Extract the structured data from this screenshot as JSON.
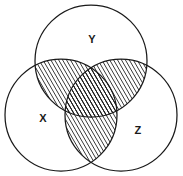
{
  "figure": {
    "background_color": "#ffffff",
    "stroke_color": "#1a1a1a",
    "hatch_color": "#1a1a1a",
    "width": 183,
    "height": 176
  },
  "sets": [
    {
      "id": "X",
      "label": "X",
      "label_x": 43,
      "label_y": 119,
      "cx": 61,
      "cy": 115,
      "r": 56
    },
    {
      "id": "Y",
      "label": "Y",
      "label_x": 92,
      "label_y": 40,
      "cx": 91,
      "cy": 61,
      "r": 56
    },
    {
      "id": "Z",
      "label": "Z",
      "label_x": 138,
      "label_y": 131,
      "cx": 121,
      "cy": 115,
      "r": 56
    }
  ],
  "shading": {
    "pattern": "diagonal-hatch",
    "angle_degrees": -30,
    "line_spacing_px": 3,
    "line_width_px": 1,
    "shaded_regions": [
      "X-and-Y",
      "Y-and-Z",
      "X-and-Z",
      "X-and-Y-and-Z"
    ],
    "unshaded_regions": [
      "X-only",
      "Y-only",
      "Z-only",
      "outside-all"
    ],
    "expression": "(X n Y) u (Y n Z) u (X n Z)"
  }
}
